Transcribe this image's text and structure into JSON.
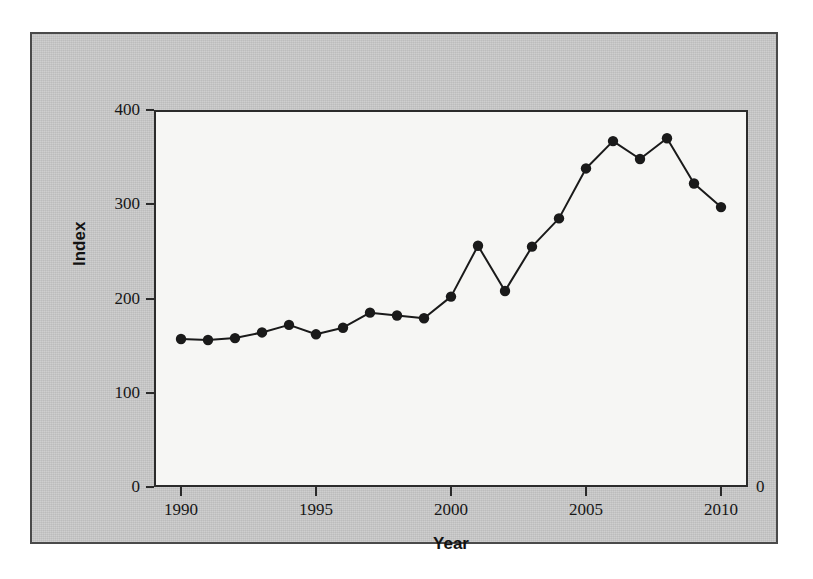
{
  "chart_data": {
    "type": "line",
    "title": "",
    "subtitle": "",
    "xlabel": "Year",
    "ylabel": "Index",
    "xlim": [
      1989,
      2011
    ],
    "ylim": [
      0,
      400
    ],
    "grid": false,
    "legend": null,
    "marker": "filled-circle",
    "line_color": "#1a1a1a",
    "marker_color": "#1a1a1a",
    "background_color": "#c9c9c9",
    "plot_background_color": "#f6f6f4",
    "x": [
      1990,
      1991,
      1992,
      1993,
      1994,
      1995,
      1996,
      1997,
      1998,
      1999,
      2000,
      2001,
      2002,
      2003,
      2004,
      2005,
      2006,
      2007,
      2008,
      2009,
      2010
    ],
    "values": [
      157,
      156,
      158,
      164,
      172,
      162,
      169,
      185,
      182,
      179,
      202,
      256,
      208,
      255,
      285,
      338,
      367,
      348,
      370,
      322,
      297
    ],
    "series": [
      {
        "name": "Index",
        "values": [
          157,
          156,
          158,
          164,
          172,
          162,
          169,
          185,
          182,
          179,
          202,
          256,
          208,
          255,
          285,
          338,
          367,
          348,
          370,
          322,
          297
        ]
      }
    ],
    "y_ticks": [
      0,
      100,
      200,
      300,
      400
    ],
    "y_tick_labels": [
      "0",
      "100",
      "200",
      "300",
      "400"
    ],
    "x_ticks": [
      1990,
      1995,
      2000,
      2005,
      2010
    ],
    "x_tick_labels": [
      "1990",
      "1995",
      "2000",
      "2005",
      "2010"
    ],
    "annotations": [
      {
        "name": "right-zero-label",
        "text": "0"
      }
    ]
  },
  "axes": {
    "y_title": "Index",
    "x_title": "Year"
  }
}
